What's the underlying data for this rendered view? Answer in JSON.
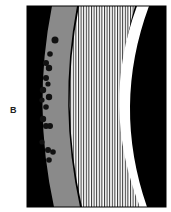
{
  "figure": {
    "panel_label": "B",
    "colors": {
      "background": "#000000",
      "outer_band": "#8a8a8a",
      "stripe_fill": "#ffffff",
      "stripe_line": "#222222",
      "crescent": "#ffffff",
      "dots": "#111111",
      "frame": "#000000"
    },
    "dots": [
      [
        55,
        40,
        3.5
      ],
      [
        50,
        54,
        2.8
      ],
      [
        46,
        63,
        3
      ],
      [
        49,
        68,
        3.2
      ],
      [
        46,
        78,
        3
      ],
      [
        48,
        84,
        2.6
      ],
      [
        43,
        90,
        3.2
      ],
      [
        49,
        97,
        3.2
      ],
      [
        42,
        100,
        2.6
      ],
      [
        46,
        107,
        2.8
      ],
      [
        43,
        119,
        3.2
      ],
      [
        46,
        126,
        3
      ],
      [
        50,
        126,
        3
      ],
      [
        42,
        142,
        2.6
      ],
      [
        48,
        150,
        3
      ],
      [
        53,
        152,
        2.8
      ],
      [
        49,
        160,
        2.8
      ]
    ]
  }
}
